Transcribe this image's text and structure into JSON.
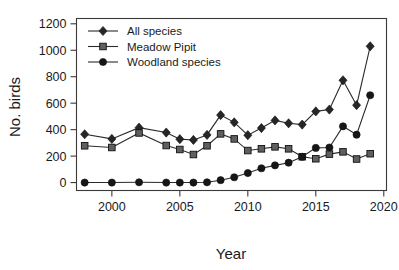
{
  "chart_data": {
    "type": "line",
    "title": "",
    "xlabel": "Year",
    "ylabel": "No. birds",
    "xlim": [
      1997.4,
      2020.2
    ],
    "ylim": [
      -60,
      1240
    ],
    "grid": false,
    "legend_position": "top-left",
    "x": [
      1998,
      1999,
      2000,
      2001,
      2002,
      2003,
      2004,
      2005,
      2006,
      2007,
      2008,
      2009,
      2010,
      2011,
      2012,
      2013,
      2014,
      2015,
      2016,
      2017,
      2018,
      2019
    ],
    "x_ticks": [
      2000,
      2005,
      2010,
      2015,
      2020
    ],
    "x_tick_labels": [
      "2000",
      "2005",
      "2010",
      "2015",
      "2020"
    ],
    "y_ticks": [
      0,
      200,
      400,
      600,
      800,
      1000,
      1200
    ],
    "y_tick_labels": [
      "0",
      "200",
      "400",
      "600",
      "800",
      "1000",
      "1200"
    ],
    "series": [
      {
        "name": "All species",
        "marker": "diamond",
        "color": "#262626",
        "x": [
          1998,
          2000,
          2002,
          2004,
          2005,
          2006,
          2007,
          2008,
          2009,
          2010,
          2011,
          2012,
          2013,
          2014,
          2015,
          2016,
          2017,
          2018,
          2019
        ],
        "values": [
          365,
          330,
          415,
          378,
          328,
          322,
          360,
          510,
          455,
          358,
          412,
          470,
          448,
          438,
          538,
          552,
          773,
          585,
          1030
        ]
      },
      {
        "name": "Meadow Pipit",
        "marker": "square",
        "color": "#5f5f5f",
        "x": [
          1998,
          2000,
          2002,
          2004,
          2005,
          2006,
          2007,
          2008,
          2009,
          2010,
          2011,
          2012,
          2013,
          2014,
          2015,
          2016,
          2017,
          2018,
          2019
        ],
        "values": [
          278,
          265,
          375,
          280,
          250,
          212,
          278,
          368,
          330,
          242,
          255,
          270,
          255,
          195,
          180,
          215,
          232,
          178,
          218
        ]
      },
      {
        "name": "Woodland species",
        "marker": "circle",
        "color": "#161616",
        "x": [
          1998,
          2000,
          2002,
          2004,
          2005,
          2006,
          2007,
          2008,
          2009,
          2010,
          2011,
          2012,
          2013,
          2014,
          2015,
          2016,
          2017,
          2018,
          2019
        ],
        "values": [
          0,
          0,
          2,
          0,
          0,
          0,
          2,
          18,
          40,
          72,
          108,
          130,
          150,
          195,
          262,
          265,
          425,
          362,
          660
        ]
      }
    ]
  },
  "legend": {
    "items": [
      {
        "label": "All species"
      },
      {
        "label": "Meadow Pipit"
      },
      {
        "label": "Woodland species"
      }
    ]
  },
  "axes": {
    "x_title": "Year",
    "y_title": "No. birds"
  }
}
